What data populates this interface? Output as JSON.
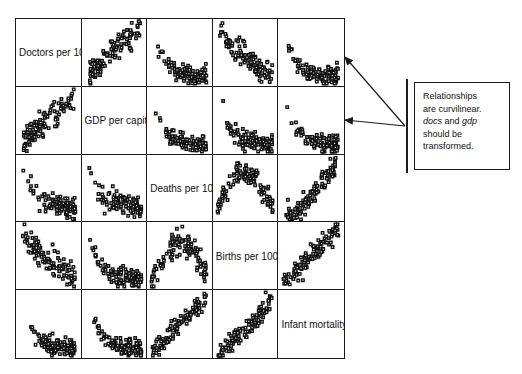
{
  "figure": {
    "type": "scatterplot-matrix",
    "variables": [
      "Doctors per 10,000 p",
      "GDP per capita",
      "Deaths per 1000 peop",
      "Births per 1000 po",
      "Infant mortality rat"
    ],
    "short_names": [
      "docs",
      "gdp",
      "deaths",
      "births",
      "infmort"
    ],
    "marker": "open-square",
    "grid_rows": 5,
    "grid_cols": 5,
    "border_color": "#1a1a1a",
    "background_color": "#ffffff"
  },
  "annotation": {
    "line1": "Relationships",
    "line2": "are curvilinear.",
    "line3_pre": "",
    "line3_em1": "docs",
    "line3_mid": " and ",
    "line3_em2": "gdp",
    "line4": "should be",
    "line5": "transformed.",
    "targets": [
      "panel-row1-col5",
      "panel-row2-col5"
    ],
    "arrow_count": 2
  },
  "chart_data": {
    "type": "scatter",
    "title": "",
    "xlabel": "",
    "ylabel": "",
    "legend": "none",
    "grid": false,
    "matrix": true,
    "variables": [
      {
        "key": "docs",
        "label": "Doctors per 10,000 p"
      },
      {
        "key": "gdp",
        "label": "GDP per capita"
      },
      {
        "key": "deaths",
        "label": "Deaths per 1000 peop"
      },
      {
        "key": "births",
        "label": "Births per 1000 po"
      },
      {
        "key": "infmort",
        "label": "Infant mortality rat"
      }
    ],
    "panels": [
      {
        "row": 1,
        "col": 1,
        "kind": "diagonal",
        "label": "Doctors per 10,000 p"
      },
      {
        "row": 1,
        "col": 2,
        "kind": "scatter",
        "x": "gdp",
        "y": "docs",
        "shape": "curvilinear-increasing",
        "density": "low-left-cluster"
      },
      {
        "row": 1,
        "col": 3,
        "kind": "scatter",
        "x": "deaths",
        "y": "docs",
        "shape": "curvilinear-decreasing-L",
        "density": "low-right-cluster"
      },
      {
        "row": 1,
        "col": 4,
        "kind": "scatter",
        "x": "births",
        "y": "docs",
        "shape": "curvilinear-decreasing",
        "density": "diagonal-decay"
      },
      {
        "row": 1,
        "col": 5,
        "kind": "scatter",
        "x": "infmort",
        "y": "docs",
        "shape": "curvilinear-decreasing-L",
        "density": "low-right-cluster"
      },
      {
        "row": 2,
        "col": 1,
        "kind": "scatter",
        "x": "docs",
        "y": "gdp",
        "shape": "curvilinear-increasing",
        "density": "low-left-cluster"
      },
      {
        "row": 2,
        "col": 2,
        "kind": "diagonal",
        "label": "GDP per capita"
      },
      {
        "row": 2,
        "col": 3,
        "kind": "scatter",
        "x": "deaths",
        "y": "gdp",
        "shape": "curvilinear-decreasing-L",
        "density": "bottom-band"
      },
      {
        "row": 2,
        "col": 4,
        "kind": "scatter",
        "x": "births",
        "y": "gdp",
        "shape": "curvilinear-decreasing-L",
        "density": "bottom-band"
      },
      {
        "row": 2,
        "col": 5,
        "kind": "scatter",
        "x": "infmort",
        "y": "gdp",
        "shape": "curvilinear-decreasing-L",
        "density": "bottom-band"
      },
      {
        "row": 3,
        "col": 1,
        "kind": "scatter",
        "x": "docs",
        "y": "deaths",
        "shape": "u-shaped-decay",
        "density": "left-spike"
      },
      {
        "row": 3,
        "col": 2,
        "kind": "scatter",
        "x": "gdp",
        "y": "deaths",
        "shape": "u-shaped-decay",
        "density": "left-spike"
      },
      {
        "row": 3,
        "col": 3,
        "kind": "diagonal",
        "label": "Deaths per 1000 peop"
      },
      {
        "row": 3,
        "col": 4,
        "kind": "scatter",
        "x": "births",
        "y": "deaths",
        "shape": "u-shaped",
        "density": "broad-u"
      },
      {
        "row": 3,
        "col": 5,
        "kind": "scatter",
        "x": "infmort",
        "y": "deaths",
        "shape": "j-shaped-increasing",
        "density": "curved-positive"
      },
      {
        "row": 4,
        "col": 1,
        "kind": "scatter",
        "x": "docs",
        "y": "births",
        "shape": "curvilinear-decreasing",
        "density": "diagonal-decay"
      },
      {
        "row": 4,
        "col": 2,
        "kind": "scatter",
        "x": "gdp",
        "y": "births",
        "shape": "curvilinear-decreasing-L",
        "density": "left-spike"
      },
      {
        "row": 4,
        "col": 3,
        "kind": "scatter",
        "x": "deaths",
        "y": "births",
        "shape": "inverted-u",
        "density": "broad-arc"
      },
      {
        "row": 4,
        "col": 4,
        "kind": "diagonal",
        "label": "Births per 1000 po"
      },
      {
        "row": 4,
        "col": 5,
        "kind": "scatter",
        "x": "infmort",
        "y": "births",
        "shape": "positive-linear",
        "density": "tight-diagonal"
      },
      {
        "row": 5,
        "col": 1,
        "kind": "scatter",
        "x": "docs",
        "y": "infmort",
        "shape": "curvilinear-decreasing-L",
        "density": "low-right-cluster"
      },
      {
        "row": 5,
        "col": 2,
        "kind": "scatter",
        "x": "gdp",
        "y": "infmort",
        "shape": "curvilinear-decreasing-L",
        "density": "bottom-band"
      },
      {
        "row": 5,
        "col": 3,
        "kind": "scatter",
        "x": "deaths",
        "y": "infmort",
        "shape": "positive-linear",
        "density": "tight-diagonal"
      },
      {
        "row": 5,
        "col": 4,
        "kind": "scatter",
        "x": "births",
        "y": "infmort",
        "shape": "positive-curvilinear",
        "density": "tight-diagonal"
      },
      {
        "row": 5,
        "col": 5,
        "kind": "diagonal",
        "label": "Infant mortality rat"
      }
    ],
    "n_points_per_panel": 110,
    "annotations": [
      {
        "text": "Relationships are curvilinear. docs and gdp should be transformed.",
        "points_to": [
          "row1-col5",
          "row2-col5"
        ]
      }
    ]
  }
}
